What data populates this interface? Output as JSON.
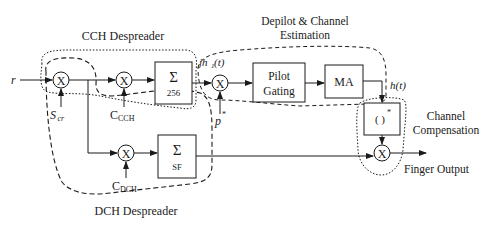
{
  "diagram": {
    "input_label": "r",
    "groups": {
      "cch_despreader": "CCH Despreader",
      "depilot_line1": "Depilot & Channel",
      "depilot_line2": "Estimation",
      "channel_comp_line1": "Channel",
      "channel_comp_line2": "Compensation",
      "dch_despreader": "DCH Despreader"
    },
    "blocks": {
      "sum_cch_symbol": "Σ",
      "sum_cch_sub": "256",
      "sum_dch_symbol": "Σ",
      "sum_dch_sub": "SF",
      "pilot_line1": "Pilot",
      "pilot_line2": "Gating",
      "ma": "MA",
      "conj": "( )",
      "conj_sup": "*"
    },
    "multiplier_symbol": "X",
    "signals": {
      "scr_main": "S",
      "scr_sub": "cr",
      "cch_main": "C",
      "cch_sub": "CCH",
      "dch_main": "C",
      "dch_sub": "DCH",
      "pilot_conj": "p",
      "pilot_conj_sup": "*",
      "jh_pre": "jh",
      "jh_sub": "1",
      "jh_post": "(t)",
      "ht": "h(t)",
      "finger_output": "Finger Output"
    },
    "colors": {
      "stroke": "#1a1a1a",
      "background": "#ffffff"
    }
  }
}
